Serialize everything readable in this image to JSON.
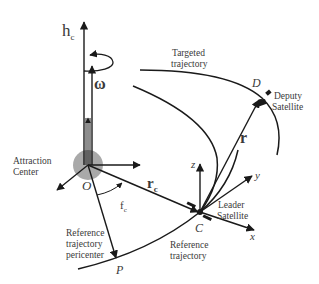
{
  "diagram": {
    "type": "orbital-geometry",
    "labels": {
      "h_c": "h",
      "h_c_sub": "c",
      "omega": "ω",
      "attraction_center": [
        "Attraction",
        "Center"
      ],
      "origin": "O",
      "r_c": "r",
      "r_c_sub": "c",
      "f_c": "f",
      "f_c_sub": "c",
      "reference_pericenter": [
        "Reference",
        "trajectory",
        "pericenter"
      ],
      "P": "P",
      "C": "C",
      "reference_trajectory": [
        "Reference",
        "trajectory"
      ],
      "leader_satellite": [
        "Leader",
        "Satellite"
      ],
      "x": "x",
      "y": "y",
      "z": "z",
      "r": "r",
      "D": "D",
      "deputy_satellite": [
        "Deputy",
        "Satellite"
      ],
      "targeted_trajectory": [
        "Targeted",
        "trajectory"
      ]
    },
    "colors": {
      "line": "#1a1a1a",
      "text": "#3a3a3a",
      "attraction_disk": "#9a9a9a"
    }
  }
}
